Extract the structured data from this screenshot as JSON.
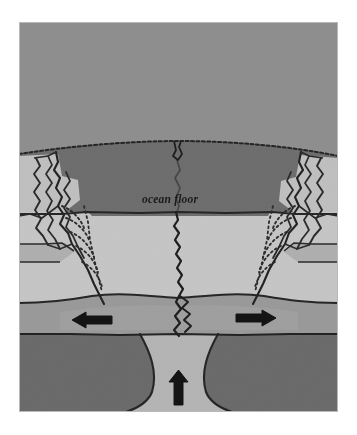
{
  "figure": {
    "kind": "geological-cross-section",
    "canvas": {
      "width": 357,
      "height": 435
    },
    "background_color": "#ffffff",
    "plate_frame": {
      "x": 19,
      "y": 22,
      "width": 319,
      "height": 390
    }
  },
  "labels": {
    "ocean_floor": "ocean floor"
  },
  "colors": {
    "page_background": "#ffffff",
    "water_layer": "#8f8f8f",
    "crust_dark_band": "#6e6e6e",
    "crust_light_band": "#c6c6c6",
    "mid_gray_band": "#9a9a9a",
    "mantle_dark": "#6b6b6b",
    "magma_light": "#b5b5b5",
    "line_ink": "#2b2b2b",
    "arrow_fill": "#141414"
  },
  "layers": [
    {
      "name": "ocean-water",
      "label": "",
      "color": "#8f8f8f",
      "top": 22,
      "bottom": 150
    },
    {
      "name": "upper-crust-dark",
      "label": "",
      "color": "#6e6e6e",
      "top": 150,
      "bottom": 212
    },
    {
      "name": "lower-crust-light",
      "label": "",
      "color": "#c6c6c6",
      "top": 212,
      "bottom": 300
    },
    {
      "name": "asthenosphere-band",
      "label": "",
      "color": "#9a9a9a",
      "top": 300,
      "bottom": 333
    },
    {
      "name": "mantle-dark",
      "label": "",
      "color": "#6b6b6b",
      "top": 333,
      "bottom": 412
    }
  ],
  "arrows": [
    {
      "name": "left-spreading-arrow",
      "direction": "left",
      "x": 72,
      "y": 320,
      "length": 40,
      "description": "plate moving left"
    },
    {
      "name": "right-spreading-arrow",
      "direction": "right",
      "x": 237,
      "y": 318,
      "length": 40,
      "description": "plate moving right"
    },
    {
      "name": "upwelling-magma-arrow",
      "direction": "up",
      "x": 178,
      "y": 378,
      "length": 30,
      "description": "magma rising"
    }
  ],
  "features": [
    {
      "name": "central-rift",
      "description": "jagged vertical fracture from ocean floor to magma chamber"
    },
    {
      "name": "left-fault-zone",
      "description": "wavy and dotted fault block structures on left flank"
    },
    {
      "name": "right-fault-zone",
      "description": "wavy and dotted fault block structures on right flank"
    },
    {
      "name": "ocean-floor-boundary",
      "description": "dotted arcing boundary between water and seafloor"
    }
  ]
}
